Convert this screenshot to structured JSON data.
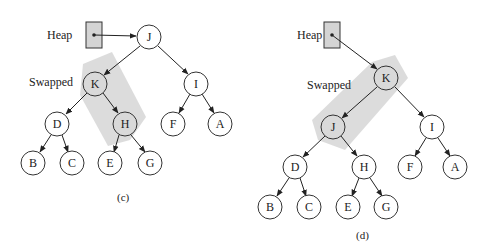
{
  "figures": [
    {
      "id": "c",
      "caption": "(c)",
      "heap_label": "Heap",
      "swapped_label": "Swapped",
      "nodes": [
        {
          "key": "J",
          "x": 149,
          "y": 37,
          "highlight": false
        },
        {
          "key": "K",
          "x": 95,
          "y": 84,
          "highlight": true
        },
        {
          "key": "I",
          "x": 196,
          "y": 84,
          "highlight": false
        },
        {
          "key": "D",
          "x": 57,
          "y": 124,
          "highlight": false
        },
        {
          "key": "H",
          "x": 125,
          "y": 124,
          "highlight": true
        },
        {
          "key": "F",
          "x": 173,
          "y": 124,
          "highlight": false
        },
        {
          "key": "A",
          "x": 220,
          "y": 124,
          "highlight": false
        },
        {
          "key": "B",
          "x": 33,
          "y": 163,
          "highlight": false
        },
        {
          "key": "C",
          "x": 72,
          "y": 163,
          "highlight": false
        },
        {
          "key": "E",
          "x": 110,
          "y": 163,
          "highlight": false
        },
        {
          "key": "G",
          "x": 150,
          "y": 163,
          "highlight": false
        }
      ],
      "edges": [
        [
          "J",
          "K"
        ],
        [
          "J",
          "I"
        ],
        [
          "K",
          "D"
        ],
        [
          "K",
          "H"
        ],
        [
          "I",
          "F"
        ],
        [
          "I",
          "A"
        ],
        [
          "D",
          "B"
        ],
        [
          "D",
          "C"
        ],
        [
          "H",
          "E"
        ],
        [
          "H",
          "G"
        ]
      ],
      "heap_points_to": "J"
    },
    {
      "id": "d",
      "caption": "(d)",
      "heap_label": "Heap",
      "swapped_label": "Swapped",
      "nodes": [
        {
          "key": "K",
          "x": 386,
          "y": 78,
          "highlight": true
        },
        {
          "key": "J",
          "x": 333,
          "y": 127,
          "highlight": true
        },
        {
          "key": "I",
          "x": 432,
          "y": 127,
          "highlight": false
        },
        {
          "key": "D",
          "x": 295,
          "y": 167,
          "highlight": false
        },
        {
          "key": "H",
          "x": 364,
          "y": 167,
          "highlight": false
        },
        {
          "key": "F",
          "x": 410,
          "y": 167,
          "highlight": false
        },
        {
          "key": "A",
          "x": 455,
          "y": 167,
          "highlight": false
        },
        {
          "key": "B",
          "x": 270,
          "y": 207,
          "highlight": false
        },
        {
          "key": "C",
          "x": 309,
          "y": 207,
          "highlight": false
        },
        {
          "key": "E",
          "x": 348,
          "y": 207,
          "highlight": false
        },
        {
          "key": "G",
          "x": 386,
          "y": 207,
          "highlight": false
        }
      ],
      "edges": [
        [
          "K",
          "J"
        ],
        [
          "K",
          "I"
        ],
        [
          "J",
          "D"
        ],
        [
          "J",
          "H"
        ],
        [
          "I",
          "F"
        ],
        [
          "I",
          "A"
        ],
        [
          "D",
          "B"
        ],
        [
          "D",
          "C"
        ],
        [
          "H",
          "E"
        ],
        [
          "H",
          "G"
        ]
      ],
      "heap_points_to": "K"
    }
  ],
  "colors": {
    "node_fill": "#ffffff",
    "highlight_fill": "#d9d9d9",
    "band": "#d6d6d6",
    "stroke": "#333333",
    "heap_box": "#d4d4d4"
  }
}
